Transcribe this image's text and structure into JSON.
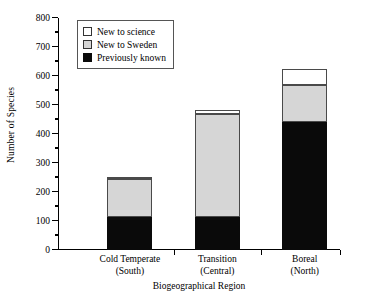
{
  "chart_data": {
    "type": "bar",
    "subtype": "stacked-bar",
    "title": "",
    "xlabel": "Biogeographical Region",
    "ylabel": "Number of Species",
    "categories": [
      "Cold Temperate (South)",
      "Transition (Central)",
      "Boreal (North)"
    ],
    "category_lines": [
      [
        "Cold Temperate",
        "(South)"
      ],
      [
        "Transition",
        "(Central)"
      ],
      [
        "Boreal",
        "(North)"
      ]
    ],
    "series": [
      {
        "name": "Previously known",
        "color": "#0a0a0a",
        "values": [
          115,
          113,
          443
        ]
      },
      {
        "name": "New to Sweden",
        "color": "#d6d6d6",
        "values": [
          133,
          355,
          127
        ]
      },
      {
        "name": "New to science",
        "color": "#ffffff",
        "values": [
          4,
          15,
          55
        ]
      }
    ],
    "stack_order": [
      "Previously known",
      "New to Sweden",
      "New to science"
    ],
    "cumulative_tops": [
      [
        115,
        248,
        252
      ],
      [
        113,
        468,
        483
      ],
      [
        443,
        570,
        625
      ]
    ],
    "totals": [
      252,
      483,
      625
    ],
    "ylim": [
      0,
      800
    ],
    "ymajor_ticks": [
      0,
      100,
      200,
      300,
      400,
      500,
      600,
      700,
      800
    ],
    "yminor_ticks": [
      50,
      150,
      250,
      350,
      450,
      550,
      650,
      750
    ],
    "ytick_labels": [
      "0",
      "100",
      "200",
      "300",
      "400",
      "500",
      "600",
      "700",
      "800"
    ],
    "grid": false,
    "legend_position": "top-left",
    "legend_entries": [
      {
        "label": "New to science",
        "swatch": "science"
      },
      {
        "label": "New to Sweden",
        "swatch": "sweden"
      },
      {
        "label": "Previously known",
        "swatch": "known"
      }
    ]
  }
}
